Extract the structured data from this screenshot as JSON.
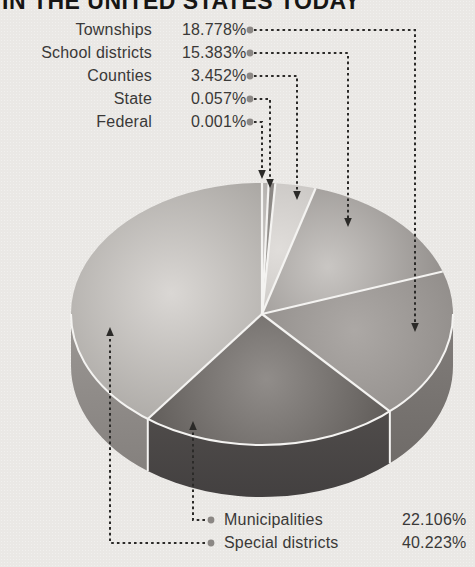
{
  "title": "IN THE UNITED STATES TODAY",
  "chart_data": {
    "type": "pie",
    "style": "3d-exploded-none, clockwise from 12 o'clock",
    "title": "IN THE UNITED STATES TODAY",
    "unit": "%",
    "total": 100.0,
    "slices": [
      {
        "label": "Federal",
        "value": 0.001,
        "pct_text": "0.001%",
        "top_light": "#c8c5c2",
        "top_dark": "#b2afac",
        "side": null,
        "side_dark": null
      },
      {
        "label": "State",
        "value": 0.057,
        "pct_text": "0.057%",
        "top_light": "#96938f",
        "top_dark": "#878380",
        "side": null,
        "side_dark": null
      },
      {
        "label": "Counties",
        "value": 3.452,
        "pct_text": "3.452%",
        "top_light": "#e0ddda",
        "top_dark": "#c9c6c3",
        "side": null,
        "side_dark": null
      },
      {
        "label": "School districts",
        "value": 15.383,
        "pct_text": "15.383%",
        "top_light": "#c9c6c3",
        "top_dark": "#8d8986",
        "side": null,
        "side_dark": null
      },
      {
        "label": "Townships",
        "value": 18.778,
        "pct_text": "18.778%",
        "top_light": "#aca8a5",
        "top_dark": "#8f8b88",
        "side": "#827e7b",
        "side_dark": "#6b6764"
      },
      {
        "label": "Municipalities",
        "value": 22.106,
        "pct_text": "22.106%",
        "top_light": "#918d8a",
        "top_dark": "#595552",
        "side": "#5e5a57",
        "side_dark": "#434040"
      },
      {
        "label": "Special districts",
        "value": 40.223,
        "pct_text": "40.223%",
        "top_light": "#dad7d4",
        "top_dark": "#a3a09c",
        "side": "#9b9794",
        "side_dark": "#817d7a"
      }
    ],
    "colors": {
      "background": "#eae8e5",
      "label_text": "#3a3938",
      "title_text": "#161514",
      "leader_line": "#2b2a28",
      "bullet": "#8b8784",
      "slice_separator": "#f4f3f1"
    }
  }
}
